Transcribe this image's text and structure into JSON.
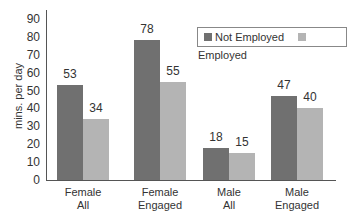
{
  "chart_data": {
    "type": "bar",
    "title": "",
    "xlabel": "",
    "ylabel": "mins. per day",
    "ylim": [
      0,
      90
    ],
    "yticks": [
      0,
      10,
      20,
      30,
      40,
      50,
      60,
      70,
      80,
      90
    ],
    "grid": false,
    "legend_position": "top-right",
    "categories": [
      "Female All",
      "Female Engaged",
      "Male All",
      "Male Engaged"
    ],
    "category_lines": [
      [
        "Female",
        "All"
      ],
      [
        "Female",
        "Engaged"
      ],
      [
        "Male",
        "All"
      ],
      [
        "Male",
        "Engaged"
      ]
    ],
    "series": [
      {
        "name": "Not Employed",
        "color": "#707070",
        "values": [
          53,
          78,
          18,
          47
        ]
      },
      {
        "name": "Employed",
        "color": "#b4b4b4",
        "values": [
          34,
          55,
          15,
          40
        ]
      }
    ]
  }
}
